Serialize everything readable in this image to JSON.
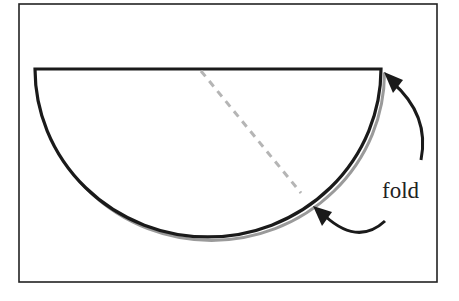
{
  "diagram": {
    "label": "fold",
    "colors": {
      "stroke": "#1a1a1a",
      "dash": "#b5b5b5",
      "shadow": "#9a9a9a",
      "background": "#ffffff"
    }
  }
}
